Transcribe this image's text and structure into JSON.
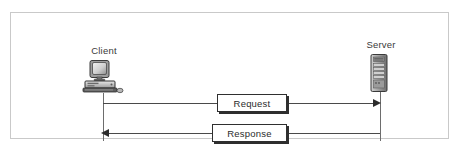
{
  "diagram": {
    "frame": {
      "border_color": "#c9c9c9",
      "background": "#ffffff"
    },
    "nodes": [
      {
        "id": "client",
        "label": "Client",
        "icon": "desktop-computer-icon"
      },
      {
        "id": "server",
        "label": "Server",
        "icon": "server-tower-icon"
      }
    ],
    "messages": [
      {
        "id": "request",
        "label": "Request",
        "direction": "client-to-server",
        "arrow": "right"
      },
      {
        "id": "response",
        "label": "Response",
        "direction": "server-to-client",
        "arrow": "left"
      }
    ],
    "colors": {
      "line": "#4a4a4a",
      "lifeline": "#6d6d6d",
      "box_border": "#2f2f2f",
      "box_shadow": "#2f2f2f",
      "text": "#2b2b2b",
      "label_text": "#3a3a3a"
    }
  }
}
